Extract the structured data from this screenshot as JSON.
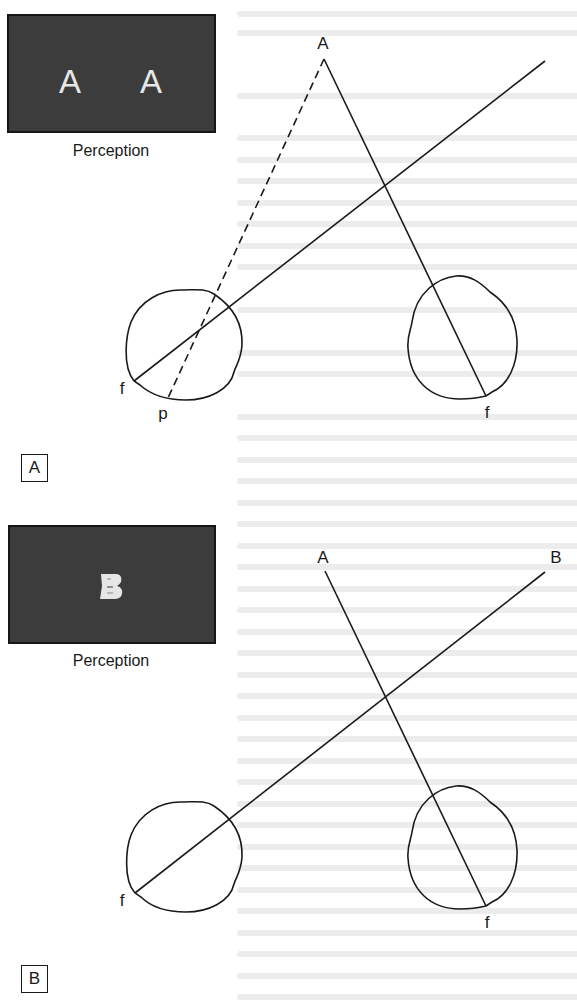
{
  "figure": {
    "colors": {
      "ink": "#1a1a1a",
      "percept_fill": "#3c3c3c",
      "percept_letter": "#e6e6e6",
      "background": "#ffffff"
    },
    "panels": [
      {
        "tag": "A",
        "percept": {
          "letters": [
            "A",
            "A"
          ],
          "caption": "Perception"
        },
        "object_label": "A",
        "left_eye": {
          "fovea_label": "f",
          "point_label": "p"
        },
        "right_eye": {
          "fovea_label": "f"
        },
        "lines": [
          "dashed line from object A to point p on left retina",
          "solid line from object A to right fovea f",
          "solid line from left fovea f through left eye"
        ]
      },
      {
        "tag": "B",
        "percept": {
          "fused_letter": "A+B superimposed",
          "caption": "Perception"
        },
        "object_labels": [
          "A",
          "B"
        ],
        "left_eye": {
          "fovea_label": "f"
        },
        "right_eye": {
          "fovea_label": "f"
        },
        "lines": [
          "solid line from object A to right fovea f",
          "solid line from object B to left fovea f"
        ]
      }
    ]
  }
}
